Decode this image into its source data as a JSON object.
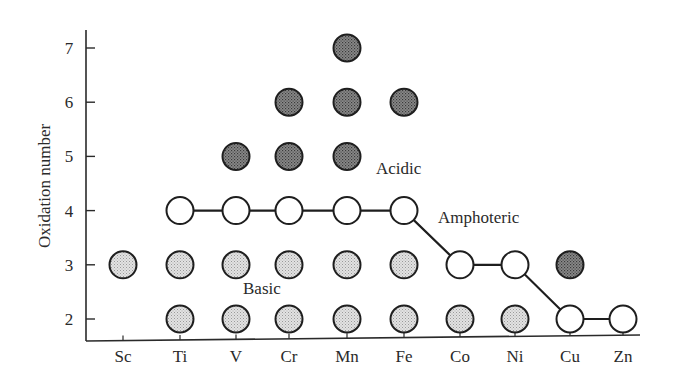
{
  "chart_data": {
    "type": "scatter",
    "title": "",
    "xlabel": "",
    "ylabel": "Oxidation number",
    "categories": [
      "Sc",
      "Ti",
      "V",
      "Cr",
      "Mn",
      "Fe",
      "Co",
      "Ni",
      "Cu",
      "Zn"
    ],
    "yticks": [
      2,
      3,
      4,
      5,
      6,
      7
    ],
    "ylim": [
      1.6,
      7.3
    ],
    "grid": false,
    "legend": null,
    "series": [
      {
        "name": "Basic",
        "style": "light-stippled",
        "points": [
          {
            "x": "Sc",
            "y": 3
          },
          {
            "x": "Ti",
            "y": 3
          },
          {
            "x": "Ti",
            "y": 2
          },
          {
            "x": "V",
            "y": 3
          },
          {
            "x": "V",
            "y": 2
          },
          {
            "x": "Cr",
            "y": 3
          },
          {
            "x": "Cr",
            "y": 2
          },
          {
            "x": "Mn",
            "y": 3
          },
          {
            "x": "Mn",
            "y": 2
          },
          {
            "x": "Fe",
            "y": 3
          },
          {
            "x": "Fe",
            "y": 2
          },
          {
            "x": "Co",
            "y": 2
          },
          {
            "x": "Ni",
            "y": 2
          }
        ]
      },
      {
        "name": "Amphoteric",
        "style": "open-connected",
        "points": [
          {
            "x": "Ti",
            "y": 4
          },
          {
            "x": "V",
            "y": 4
          },
          {
            "x": "Cr",
            "y": 4
          },
          {
            "x": "Mn",
            "y": 4
          },
          {
            "x": "Fe",
            "y": 4
          },
          {
            "x": "Co",
            "y": 3
          },
          {
            "x": "Ni",
            "y": 3
          },
          {
            "x": "Cu",
            "y": 2
          },
          {
            "x": "Zn",
            "y": 2
          }
        ]
      },
      {
        "name": "Acidic",
        "style": "dark-stippled",
        "points": [
          {
            "x": "V",
            "y": 5
          },
          {
            "x": "Cr",
            "y": 5
          },
          {
            "x": "Cr",
            "y": 6
          },
          {
            "x": "Mn",
            "y": 5
          },
          {
            "x": "Mn",
            "y": 6
          },
          {
            "x": "Mn",
            "y": 7
          },
          {
            "x": "Fe",
            "y": 6
          },
          {
            "x": "Cu",
            "y": 3
          }
        ]
      }
    ],
    "annotations": [
      {
        "text": "Acidic",
        "x": "Fe",
        "y": 5.2
      },
      {
        "text": "Amphoteric",
        "x": "Co",
        "y": 3.9
      },
      {
        "text": "Basic",
        "x": "V",
        "y": 2.6
      }
    ],
    "colors": {
      "axis": "#2a2a2a",
      "basic_fill": "#d6d6d6",
      "acidic_fill": "#6e6e6e",
      "amphoteric_fill": "#ffffff",
      "outline": "#1e1e1e"
    }
  }
}
